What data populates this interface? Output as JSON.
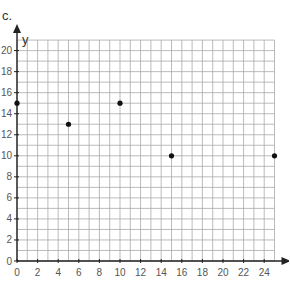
{
  "problem_label": "c.",
  "chart_data": {
    "type": "scatter",
    "title": "",
    "xlabel": "",
    "ylabel": "y",
    "xlim": [
      0,
      25
    ],
    "ylim": [
      0,
      21
    ],
    "grid": true,
    "x_ticks": [
      0,
      2,
      4,
      6,
      8,
      10,
      12,
      14,
      16,
      18,
      20,
      22,
      24
    ],
    "y_ticks": [
      0,
      2,
      4,
      6,
      8,
      10,
      12,
      14,
      16,
      18,
      20
    ],
    "points": [
      {
        "x": 0,
        "y": 15
      },
      {
        "x": 5,
        "y": 13
      },
      {
        "x": 10,
        "y": 15
      },
      {
        "x": 15,
        "y": 10
      },
      {
        "x": 25,
        "y": 10
      }
    ]
  }
}
